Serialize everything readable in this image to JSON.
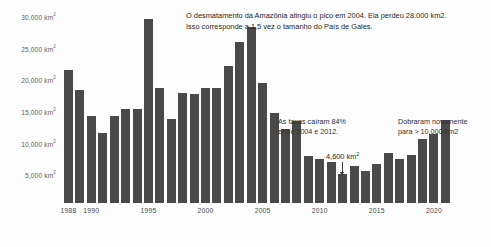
{
  "chart_data": {
    "type": "bar",
    "title": "",
    "xlabel": "",
    "ylabel": "",
    "grid": false,
    "legend": "none",
    "ylim": [
      0,
      30000
    ],
    "y_unit": "km²",
    "y_ticks": [
      {
        "value": 30000,
        "label": "30,000 km",
        "sup": "2"
      },
      {
        "value": 25000,
        "label": "25,000 km",
        "sup": "2"
      },
      {
        "value": 20000,
        "label": "20,000 km",
        "sup": "2"
      },
      {
        "value": 15000,
        "label": "15,000 km",
        "sup": "2"
      },
      {
        "value": 10000,
        "label": "10,000 km",
        "sup": "2"
      },
      {
        "value": 5000,
        "label": "5,000 km",
        "sup": "2"
      }
    ],
    "x_ticks": [
      "1988",
      "1990",
      "1995",
      "2000",
      "2005",
      "2010",
      "2015",
      "2020"
    ],
    "categories": [
      1988,
      1989,
      1990,
      1991,
      1992,
      1993,
      1994,
      1995,
      1996,
      1997,
      1998,
      1999,
      2000,
      2001,
      2002,
      2003,
      2004,
      2005,
      2006,
      2007,
      2008,
      2009,
      2010,
      2011,
      2012,
      2013,
      2014,
      2015,
      2016,
      2017,
      2018,
      2019,
      2020,
      2021
    ],
    "values": [
      21050,
      17770,
      13730,
      11030,
      13786,
      14896,
      14896,
      29059,
      18161,
      13227,
      17383,
      17259,
      18226,
      18165,
      21651,
      25396,
      27772,
      19014,
      14286,
      11651,
      12911,
      7464,
      7000,
      6418,
      4571,
      5891,
      5012,
      6207,
      7893,
      6947,
      7536,
      10129,
      10851,
      13038
    ],
    "bar_color": "#4a4a4a"
  },
  "annotations": {
    "headline": "O desmatamento da Amazônia atingiu o pico em 2004. Ela perdeu 28.000 km2.\nIsso corresponde a 1,5 vez o tamanho do País de Gales.",
    "drop": "As taxas caíram 84%\nentre 2004 e 2012.",
    "rise": "Dobraram novamente\npara > 10.000 km2",
    "callout": {
      "label": "4,600 km",
      "sup": "2",
      "points_to_year": 2012
    }
  }
}
